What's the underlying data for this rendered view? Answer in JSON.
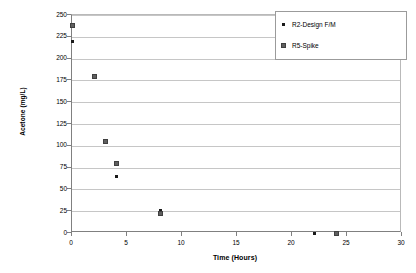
{
  "chart_data": {
    "type": "scatter",
    "title": "",
    "xlabel": "Time (Hours)",
    "ylabel": "Acetone (mg/L)",
    "xlim": [
      0,
      30
    ],
    "ylim": [
      0,
      250
    ],
    "xticks": [
      0,
      5,
      10,
      15,
      20,
      25,
      30
    ],
    "yticks": [
      0,
      25,
      50,
      75,
      100,
      125,
      150,
      175,
      200,
      225,
      250
    ],
    "grid": "horizontal",
    "legend_position": "top-right",
    "series": [
      {
        "name": "R2-Design F/M",
        "marker": "diamond",
        "color": "#1a1a1a",
        "points": [
          {
            "x": 0,
            "y": 220
          },
          {
            "x": 4,
            "y": 65
          },
          {
            "x": 8,
            "y": 26
          },
          {
            "x": 22,
            "y": 0
          }
        ]
      },
      {
        "name": "R5-Spike",
        "marker": "square",
        "color": "#5f5f5f",
        "points": [
          {
            "x": 0,
            "y": 238
          },
          {
            "x": 2,
            "y": 180
          },
          {
            "x": 3,
            "y": 105
          },
          {
            "x": 4,
            "y": 80
          },
          {
            "x": 8,
            "y": 22
          },
          {
            "x": 24,
            "y": 0
          }
        ]
      }
    ]
  },
  "axis": {
    "y_title": "Acetone (mg/L)",
    "x_title": "Time (Hours)",
    "y_tick_labels": [
      "250",
      "225",
      "200",
      "175",
      "150",
      "125",
      "100",
      "75",
      "50",
      "25",
      "0"
    ],
    "x_tick_labels": [
      "0",
      "5",
      "10",
      "15",
      "20",
      "25",
      "30"
    ]
  },
  "legend": {
    "entries": [
      {
        "label": "R2-Design F/M",
        "marker": "diamond"
      },
      {
        "label": "R5-Spike",
        "marker": "square"
      }
    ]
  }
}
